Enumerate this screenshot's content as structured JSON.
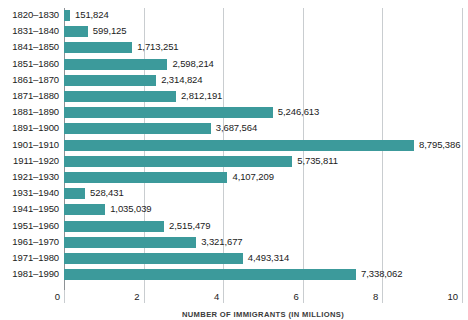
{
  "chart_data": {
    "type": "bar",
    "orientation": "horizontal",
    "title": "",
    "xlabel": "NUMBER OF IMMIGRANTS (IN MILLIONS)",
    "ylabel": "",
    "xlim": [
      0,
      10
    ],
    "xticks": [
      0,
      2,
      4,
      6,
      8,
      10
    ],
    "xtick_labels": [
      "0",
      "2",
      "4",
      "6",
      "8",
      "10"
    ],
    "grid": true,
    "grid_axis": "x",
    "legend": false,
    "units": "millions",
    "bar_color": "#3c9a9b",
    "categories": [
      "1820–1830",
      "1831–1840",
      "1841–1850",
      "1851–1860",
      "1861–1870",
      "1871–1880",
      "1881–1890",
      "1891–1900",
      "1901–1910",
      "1911–1920",
      "1921–1930",
      "1931–1940",
      "1941–1950",
      "1951–1960",
      "1961–1970",
      "1971–1980",
      "1981–1990"
    ],
    "values": [
      151824,
      599125,
      1713251,
      2598214,
      2314824,
      2812191,
      5246613,
      3687564,
      8795386,
      5735811,
      4107209,
      528431,
      1035039,
      2515479,
      3321677,
      4493314,
      7338062
    ],
    "value_labels": [
      "151,824",
      "599,125",
      "1,713,251",
      "2,598,214",
      "2,314,824",
      "2,812,191",
      "5,246,613",
      "3,687,564",
      "8,795,386",
      "5,735,811",
      "4,107,209",
      "528,431",
      "1,035,039",
      "2,515,479",
      "3,321,677",
      "4,493,314",
      "7,338,062"
    ]
  }
}
